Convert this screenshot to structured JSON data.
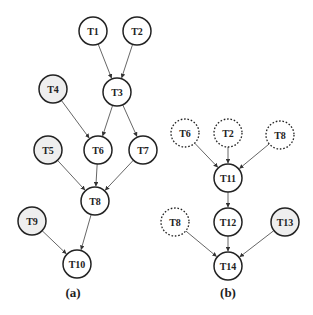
{
  "diagram": {
    "radius": 14,
    "colors": {
      "stroke": "#222222",
      "edge": "#555555",
      "shaded_fill": "#eeeeee",
      "plain_fill": "#ffffff"
    },
    "panels": [
      {
        "caption": "(a)",
        "caption_pos": [
          73,
          297
        ],
        "nodes": [
          {
            "id": "a_T1",
            "label": "T1",
            "x": 93,
            "y": 31,
            "style": "plain"
          },
          {
            "id": "a_T2",
            "label": "T2",
            "x": 137,
            "y": 31,
            "style": "plain"
          },
          {
            "id": "a_T3",
            "label": "T3",
            "x": 117,
            "y": 92,
            "style": "plain"
          },
          {
            "id": "a_T4",
            "label": "T4",
            "x": 53,
            "y": 89,
            "style": "shaded"
          },
          {
            "id": "a_T5",
            "label": "T5",
            "x": 48,
            "y": 150,
            "style": "shaded"
          },
          {
            "id": "a_T6",
            "label": "T6",
            "x": 98,
            "y": 150,
            "style": "plain"
          },
          {
            "id": "a_T7",
            "label": "T7",
            "x": 143,
            "y": 150,
            "style": "plain"
          },
          {
            "id": "a_T8",
            "label": "T8",
            "x": 95,
            "y": 201,
            "style": "plain"
          },
          {
            "id": "a_T9",
            "label": "T9",
            "x": 32,
            "y": 221,
            "style": "shaded"
          },
          {
            "id": "a_T10",
            "label": "T10",
            "x": 77,
            "y": 264,
            "style": "plain"
          }
        ],
        "edges": [
          [
            "a_T1",
            "a_T3"
          ],
          [
            "a_T2",
            "a_T3"
          ],
          [
            "a_T3",
            "a_T6"
          ],
          [
            "a_T3",
            "a_T7"
          ],
          [
            "a_T4",
            "a_T6"
          ],
          [
            "a_T5",
            "a_T8"
          ],
          [
            "a_T6",
            "a_T8"
          ],
          [
            "a_T7",
            "a_T8"
          ],
          [
            "a_T8",
            "a_T10"
          ],
          [
            "a_T9",
            "a_T10"
          ]
        ]
      },
      {
        "caption": "(b)",
        "caption_pos": [
          228,
          297
        ],
        "nodes": [
          {
            "id": "b_T6",
            "label": "T6",
            "x": 185,
            "y": 133,
            "style": "dashed"
          },
          {
            "id": "b_T2",
            "label": "T2",
            "x": 228,
            "y": 133,
            "style": "dashed"
          },
          {
            "id": "b_T8a",
            "label": "T8",
            "x": 280,
            "y": 135,
            "style": "dashed"
          },
          {
            "id": "b_T11",
            "label": "T11",
            "x": 228,
            "y": 178,
            "style": "plain"
          },
          {
            "id": "b_T8b",
            "label": "T8",
            "x": 175,
            "y": 222,
            "style": "dashed"
          },
          {
            "id": "b_T12",
            "label": "T12",
            "x": 228,
            "y": 222,
            "style": "plain"
          },
          {
            "id": "b_T13",
            "label": "T13",
            "x": 285,
            "y": 222,
            "style": "shaded"
          },
          {
            "id": "b_T14",
            "label": "T14",
            "x": 228,
            "y": 266,
            "style": "plain"
          }
        ],
        "edges": [
          [
            "b_T6",
            "b_T11"
          ],
          [
            "b_T2",
            "b_T11"
          ],
          [
            "b_T8a",
            "b_T11"
          ],
          [
            "b_T11",
            "b_T12"
          ],
          [
            "b_T8b",
            "b_T14"
          ],
          [
            "b_T12",
            "b_T14"
          ],
          [
            "b_T13",
            "b_T14"
          ]
        ]
      }
    ]
  }
}
